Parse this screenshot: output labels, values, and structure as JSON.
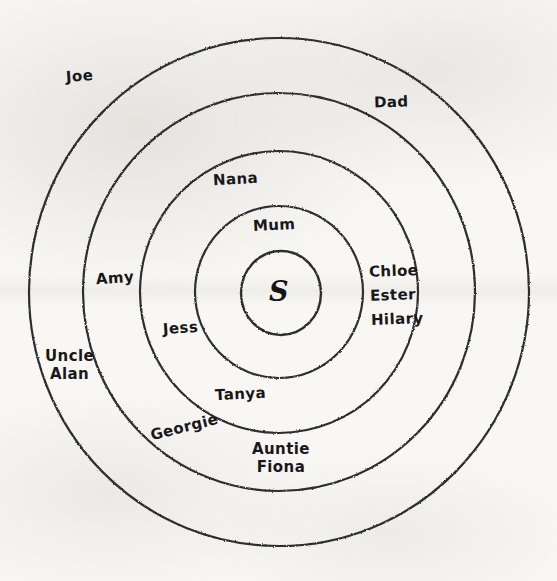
{
  "document": {
    "type": "hand-drawn concentric circles diagram",
    "title": "Circles of support",
    "background_color": "#f8f7f4",
    "ink_color": "#2e2e30"
  },
  "diagram": {
    "center": {
      "x": 279,
      "y": 292
    },
    "core": {
      "label": "S",
      "radius": 41
    },
    "rings": [
      {
        "index": 1,
        "radius": 84
      },
      {
        "index": 2,
        "radius": 139
      },
      {
        "index": 3,
        "radius": 196
      },
      {
        "index": 4,
        "radius": 250
      }
    ],
    "labels": [
      {
        "id": "joe",
        "text": "Joe",
        "ring": 4,
        "x": 66,
        "y": 68,
        "rotate": -4,
        "size": 15
      },
      {
        "id": "dad",
        "text": "Dad",
        "ring": 4,
        "x": 374,
        "y": 94,
        "rotate": -2,
        "size": 15
      },
      {
        "id": "uncle-alan",
        "text": "Uncle\nAlan",
        "ring": 4,
        "x": 45,
        "y": 348,
        "rotate": 0,
        "size": 15
      },
      {
        "id": "georgie",
        "text": "Georgie",
        "ring": 3,
        "x": 150,
        "y": 419,
        "rotate": -14,
        "size": 15
      },
      {
        "id": "amy",
        "text": "Amy",
        "ring": 3,
        "x": 96,
        "y": 270,
        "rotate": -4,
        "size": 15
      },
      {
        "id": "nana",
        "text": "Nana",
        "ring": 2,
        "x": 213,
        "y": 171,
        "rotate": -3,
        "size": 15
      },
      {
        "id": "jess",
        "text": "Jess",
        "ring": 2,
        "x": 163,
        "y": 320,
        "rotate": -4,
        "size": 15
      },
      {
        "id": "auntie-fiona",
        "text": "Auntie\nFiona",
        "ring": 3,
        "x": 252,
        "y": 441,
        "rotate": 0,
        "size": 15
      },
      {
        "id": "mum",
        "text": "Mum",
        "ring": 1,
        "x": 253,
        "y": 217,
        "rotate": -3,
        "size": 15
      },
      {
        "id": "tanya",
        "text": "Tanya",
        "ring": 2,
        "x": 215,
        "y": 386,
        "rotate": -3,
        "size": 15
      },
      {
        "id": "chloe",
        "text": "Chloe",
        "ring": 2,
        "x": 369,
        "y": 263,
        "rotate": -2,
        "size": 15
      },
      {
        "id": "ester",
        "text": "Ester",
        "ring": 2,
        "x": 370,
        "y": 287,
        "rotate": -2,
        "size": 15
      },
      {
        "id": "hilary",
        "text": "Hilary",
        "ring": 2,
        "x": 371,
        "y": 311,
        "rotate": -2,
        "size": 15
      }
    ]
  }
}
